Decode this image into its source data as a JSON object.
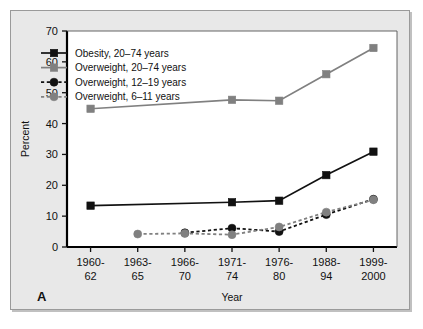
{
  "panel": {
    "letter": "A",
    "background_color": "#e8e8e8",
    "plot_background_color": "#ffffff",
    "frame_color": "#000000"
  },
  "chart_data": {
    "type": "line",
    "title": "",
    "subtitle": "",
    "xlabel": "Year",
    "ylabel": "Percent",
    "ylim": [
      0,
      70
    ],
    "yticks": [
      0,
      10,
      20,
      30,
      40,
      50,
      60,
      70
    ],
    "ytick_labels": [
      "0",
      "10",
      "20",
      "30",
      "40",
      "50",
      "60",
      "70"
    ],
    "grid": false,
    "legend_position": "top-left",
    "categories": [
      "1960-62",
      "1963-65",
      "1966-70",
      "1971-74",
      "1976-80",
      "1988-94",
      "1999-2000"
    ],
    "category_lines": [
      [
        "1960-",
        "62"
      ],
      [
        "1963-",
        "65"
      ],
      [
        "1966-",
        "70"
      ],
      [
        "1971-",
        "74"
      ],
      [
        "1976-",
        "80"
      ],
      [
        "1988-",
        "94"
      ],
      [
        "1999-",
        "2000"
      ]
    ],
    "series": [
      {
        "name": "Obesity, 20–74 years",
        "marker": "square",
        "color": "#111111",
        "linestyle": "solid",
        "values": [
          13.4,
          null,
          null,
          14.5,
          15.0,
          23.3,
          30.9
        ]
      },
      {
        "name": "Overweight, 20–74 years",
        "marker": "square",
        "color": "#808080",
        "linestyle": "solid",
        "values": [
          44.8,
          null,
          null,
          47.7,
          47.4,
          56.0,
          64.5
        ]
      },
      {
        "name": "Overweight, 12–19 years",
        "marker": "circle",
        "color": "#111111",
        "linestyle": "dashed",
        "values": [
          null,
          null,
          4.6,
          6.1,
          5.0,
          10.5,
          15.5
        ]
      },
      {
        "name": "Overweight, 6–11 years",
        "marker": "circle",
        "color": "#808080",
        "linestyle": "dashed",
        "values": [
          null,
          4.2,
          4.4,
          4.0,
          6.5,
          11.3,
          15.3
        ]
      }
    ]
  },
  "legend": {
    "entries": [
      {
        "label": "Obesity, 20–74 years",
        "marker": "square",
        "color": "#111111",
        "linestyle": "solid"
      },
      {
        "label": "Overweight, 20–74 years",
        "marker": "square",
        "color": "#808080",
        "linestyle": "solid"
      },
      {
        "label": "Overweight, 12–19 years",
        "marker": "circle",
        "color": "#111111",
        "linestyle": "dashed"
      },
      {
        "label": "Overweight, 6–11 years",
        "marker": "circle",
        "color": "#808080",
        "linestyle": "dashed"
      }
    ]
  }
}
